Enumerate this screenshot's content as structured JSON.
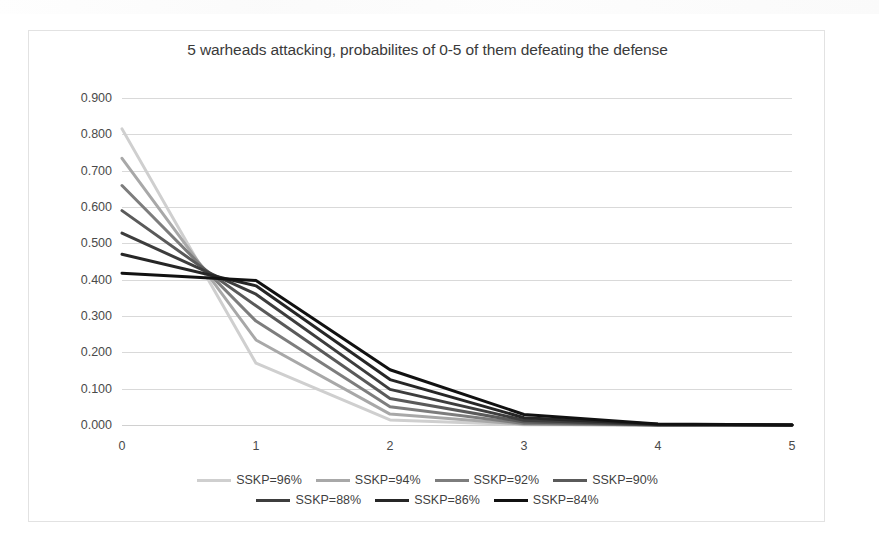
{
  "chart_data": {
    "type": "line",
    "title": "5 warheads attacking, probabilites of 0-5 of them defeating the defense",
    "xlabel": "",
    "ylabel": "",
    "x": [
      0,
      1,
      2,
      3,
      4,
      5
    ],
    "xtick_labels": [
      "0",
      "1",
      "2",
      "3",
      "4",
      "5"
    ],
    "ytick_labels": [
      "0.900",
      "0.800",
      "0.700",
      "0.600",
      "0.500",
      "0.400",
      "0.300",
      "0.200",
      "0.100",
      "0.000"
    ],
    "ytick_values": [
      0.9,
      0.8,
      0.7,
      0.6,
      0.5,
      0.4,
      0.3,
      0.2,
      0.1,
      0.0
    ],
    "ylim": [
      0.0,
      0.9
    ],
    "xlim": [
      0,
      5
    ],
    "grid": "horizontal",
    "legend_position": "bottom",
    "series": [
      {
        "name": "SSKP=96%",
        "color": "#cfcfcf",
        "values": [
          0.815,
          0.17,
          0.014,
          0.001,
          0.0,
          0.0
        ]
      },
      {
        "name": "SSKP=94%",
        "color": "#a8a8a8",
        "values": [
          0.734,
          0.234,
          0.03,
          0.002,
          0.0,
          0.0
        ]
      },
      {
        "name": "SSKP=92%",
        "color": "#7d7d7d",
        "values": [
          0.659,
          0.286,
          0.05,
          0.004,
          0.0,
          0.0
        ]
      },
      {
        "name": "SSKP=90%",
        "color": "#5a5a5a",
        "values": [
          0.59,
          0.328,
          0.073,
          0.008,
          0.0,
          0.0
        ]
      },
      {
        "name": "SSKP=88%",
        "color": "#3d3d3d",
        "values": [
          0.528,
          0.36,
          0.098,
          0.013,
          0.001,
          0.0
        ]
      },
      {
        "name": "SSKP=86%",
        "color": "#262626",
        "values": [
          0.47,
          0.383,
          0.125,
          0.02,
          0.002,
          0.0
        ]
      },
      {
        "name": "SSKP=84%",
        "color": "#111111",
        "values": [
          0.418,
          0.398,
          0.152,
          0.029,
          0.003,
          0.0
        ]
      }
    ]
  },
  "legend": {
    "row1": [
      "SSKP=96%",
      "SSKP=94%",
      "SSKP=92%",
      "SSKP=90%"
    ],
    "row2": [
      "SSKP=88%",
      "SSKP=86%",
      "SSKP=84%"
    ]
  }
}
